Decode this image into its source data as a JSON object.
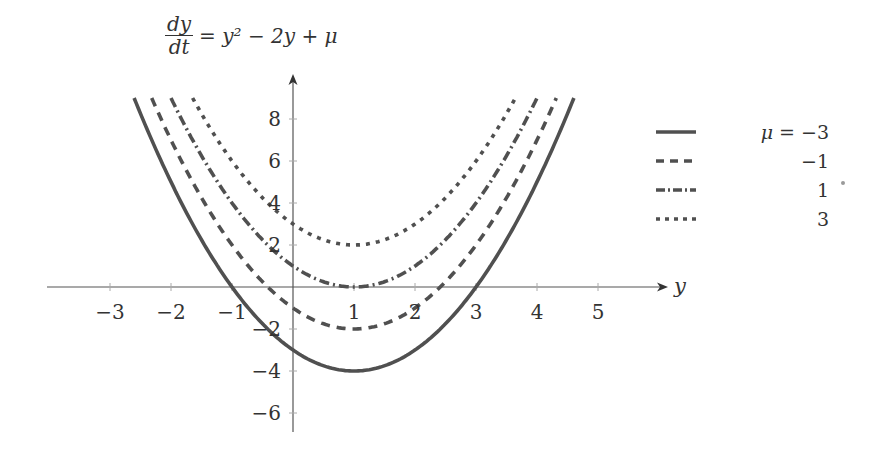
{
  "chart_data": {
    "type": "line",
    "title_parts": {
      "num": "dy",
      "den": "dt",
      "rhs_prefix": "= ",
      "rhs": "y² − 2y + μ"
    },
    "xlabel": "y",
    "ylabel": "",
    "xlim": [
      -4,
      6.3
    ],
    "ylim": [
      -7,
      9
    ],
    "x_ticks": [
      -3,
      -2,
      -1,
      1,
      2,
      3,
      4,
      5
    ],
    "x_tick_labels": [
      "−3",
      "−2",
      "−1",
      "1",
      "2",
      "3",
      "4",
      "5"
    ],
    "y_ticks": [
      -6,
      -4,
      -2,
      2,
      4,
      6,
      8
    ],
    "y_tick_labels": [
      "−6",
      "−4",
      "−2",
      "2",
      "4",
      "6",
      "8"
    ],
    "grid": false,
    "legend_position": "right",
    "function": "y^2 - 2y + mu",
    "series": [
      {
        "name": "μ = −3",
        "legend_label": "−3",
        "mu": -3,
        "style": "solid",
        "x": [
          -2.6,
          -2,
          -1,
          0,
          1,
          2,
          3,
          4,
          4.6
        ],
        "values": [
          8.96,
          5,
          0,
          -3,
          -4,
          -3,
          0,
          5,
          8.96
        ]
      },
      {
        "name": "μ = −1",
        "legend_label": "−1",
        "mu": -1,
        "style": "dashed",
        "x": [
          -2.2,
          -2,
          -1,
          0,
          1,
          2,
          3,
          4,
          4.2
        ],
        "values": [
          8.24,
          7,
          2,
          -1,
          -2,
          -1,
          2,
          7,
          8.24
        ]
      },
      {
        "name": "μ = 1",
        "legend_label": "1",
        "mu": 1,
        "style": "dash-dot",
        "x": [
          -1.9,
          -1,
          0,
          1,
          2,
          3,
          3.9
        ],
        "values": [
          8.41,
          4,
          1,
          0,
          1,
          4,
          8.41
        ]
      },
      {
        "name": "μ = 3",
        "legend_label": "3",
        "mu": 3,
        "style": "dotted",
        "x": [
          -1.6,
          -1,
          0,
          1,
          2,
          3,
          3.6
        ],
        "values": [
          8.76,
          6,
          3,
          2,
          3,
          6,
          8.76
        ]
      }
    ]
  },
  "legend": {
    "prefix": "μ = ",
    "entries": [
      "−3",
      "−1",
      "1",
      "3"
    ]
  },
  "colors": {
    "curve": "#505050",
    "axis": "#555555",
    "text": "#333333"
  }
}
